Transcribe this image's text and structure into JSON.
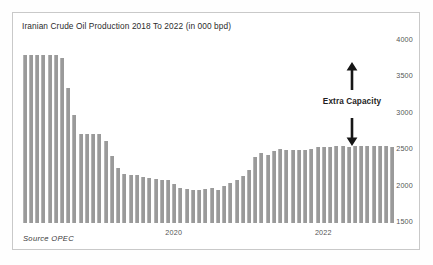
{
  "chart_data": {
    "type": "bar",
    "title": "Iranian Crude Oil Production 2018 To 2022  (in 000 bpd)",
    "xlabel": "",
    "ylabel": "",
    "unit": "thousand barrels per day",
    "source": "Source  OPEC",
    "grid": false,
    "legend": null,
    "y_axis_position": "right",
    "ylim": [
      1500,
      4000
    ],
    "yticks": [
      4000,
      3500,
      3000,
      2500,
      2000,
      1500
    ],
    "ytick_labels": [
      "4000",
      "3500",
      "3000",
      "2500",
      "2000",
      "1500"
    ],
    "xticks": [
      24,
      48
    ],
    "xtick_labels": [
      "2020",
      "2022"
    ],
    "bar_color": "#9a9a9a",
    "categories": [
      "2018-01",
      "2018-02",
      "2018-03",
      "2018-04",
      "2018-05",
      "2018-06",
      "2018-07",
      "2018-08",
      "2018-09",
      "2018-10",
      "2018-11",
      "2018-12",
      "2019-01",
      "2019-02",
      "2019-03",
      "2019-04",
      "2019-05",
      "2019-06",
      "2019-07",
      "2019-08",
      "2019-09",
      "2019-10",
      "2019-11",
      "2019-12",
      "2020-01",
      "2020-02",
      "2020-03",
      "2020-04",
      "2020-05",
      "2020-06",
      "2020-07",
      "2020-08",
      "2020-09",
      "2020-10",
      "2020-11",
      "2020-12",
      "2021-01",
      "2021-02",
      "2021-03",
      "2021-04",
      "2021-05",
      "2021-06",
      "2021-07",
      "2021-08",
      "2021-09",
      "2021-10",
      "2021-11",
      "2021-12",
      "2022-01",
      "2022-02",
      "2022-03",
      "2022-04",
      "2022-05",
      "2022-06",
      "2022-07",
      "2022-08",
      "2022-09",
      "2022-10",
      "2022-11",
      "2022-12"
    ],
    "values": [
      3810,
      3810,
      3810,
      3810,
      3810,
      3810,
      3760,
      3350,
      2980,
      2720,
      2720,
      2720,
      2720,
      2620,
      2420,
      2255,
      2180,
      2165,
      2165,
      2130,
      2115,
      2110,
      2095,
      2085,
      2040,
      1985,
      1965,
      1960,
      1955,
      1970,
      1975,
      1960,
      2010,
      2055,
      2085,
      2140,
      2230,
      2400,
      2455,
      2440,
      2490,
      2510,
      2505,
      2500,
      2500,
      2500,
      2510,
      2540,
      2545,
      2550,
      2560,
      2560,
      2550,
      2555,
      2555,
      2555,
      2560,
      2555,
      2555,
      2550
    ]
  },
  "annotation": {
    "label": "Extra Capacity",
    "up_arrow": "up-arrow",
    "down_arrow": "down-arrow"
  }
}
